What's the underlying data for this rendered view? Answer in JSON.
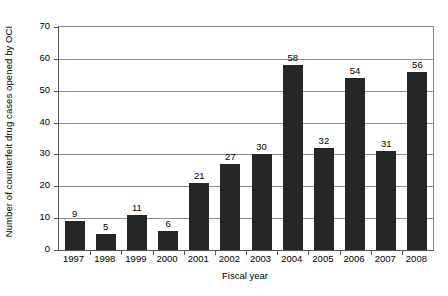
{
  "chart_data": {
    "type": "bar",
    "title": "",
    "xlabel": "Fiscal year",
    "ylabel": "Number of counterfeit drug cases opened by OCI",
    "categories": [
      "1997",
      "1998",
      "1999",
      "2000",
      "2001",
      "2002",
      "2003",
      "2004",
      "2005",
      "2006",
      "2007",
      "2008"
    ],
    "values": [
      9,
      5,
      11,
      6,
      21,
      27,
      30,
      58,
      32,
      54,
      31,
      56
    ],
    "series": [
      {
        "name": "Counterfeit drug cases opened by OCI",
        "values": [
          9,
          5,
          11,
          6,
          21,
          27,
          30,
          58,
          32,
          54,
          31,
          56
        ]
      }
    ],
    "ylim": [
      0,
      70
    ],
    "ytick_labels": [
      "0",
      "10",
      "20",
      "30",
      "40",
      "50",
      "60",
      "70"
    ],
    "ytick_values": [
      0,
      10,
      20,
      30,
      40,
      50,
      60,
      70
    ],
    "grid": true,
    "grid_axis": "y",
    "legend": false,
    "legend_position": "none",
    "data_labels": true,
    "bar_color": "#262626",
    "grid_color": "#8f8f8f",
    "axis_color": "#555555",
    "background_color": "#ffffff",
    "text_color": "#000000"
  }
}
